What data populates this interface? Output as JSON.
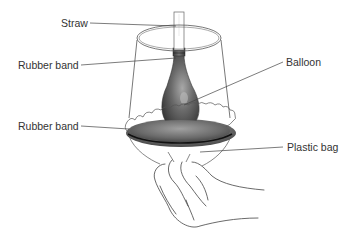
{
  "diagram": {
    "labels": {
      "straw": "Straw",
      "rubber_band_top": "Rubber band",
      "balloon": "Balloon",
      "rubber_band_bottom": "Rubber band",
      "plastic_bag": "Plastic bag"
    },
    "colors": {
      "line": "#444444",
      "balloon_dark": "#4a4a4a",
      "balloon_light": "#9a9a9a",
      "bag_shadow": "#6e6e6e",
      "text": "#333333"
    }
  }
}
